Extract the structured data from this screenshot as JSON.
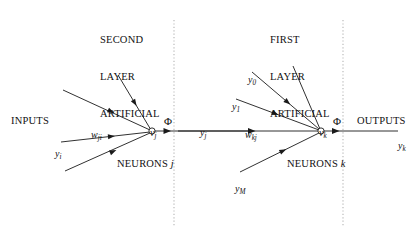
{
  "diagram": {
    "title_hidden": "",
    "background_color": "#ffffff",
    "line_color": "#1a1a1a",
    "divider_color": "#b0b0b0",
    "headers": {
      "second_layer": {
        "line1": "SECOND",
        "line2": "LAYER",
        "line3": "ARTIFICIAL",
        "line4_prefix": "NEURONS",
        "line4_index": "j"
      },
      "first_layer": {
        "line1": "FIRST",
        "line2": "LAYER",
        "line3": "ARTIFICIAL",
        "line4_prefix": "NEURONS",
        "line4_index": "k"
      }
    },
    "side_labels": {
      "inputs": "INPUTS",
      "outputs": "OUTPUTS"
    },
    "nodes": [
      {
        "id": "vj",
        "symbol": "v",
        "subscript": "j",
        "x": 152,
        "y": 131
      },
      {
        "id": "vk",
        "symbol": "v",
        "subscript": "k",
        "x": 321,
        "y": 131
      }
    ],
    "activations": [
      {
        "id": "phi-left",
        "symbol": "Φ",
        "x": 168,
        "y": 122
      },
      {
        "id": "phi-right",
        "symbol": "Φ",
        "x": 337,
        "y": 122
      }
    ],
    "signals": {
      "y_i": {
        "symbol": "y",
        "subscript": "i"
      },
      "y_j": {
        "symbol": "y",
        "subscript": "j"
      },
      "y_k": {
        "symbol": "y",
        "subscript": "k"
      },
      "y_0": {
        "symbol": "y",
        "subscript": "0"
      },
      "y_1": {
        "symbol": "y",
        "subscript": "1"
      },
      "y_M": {
        "symbol": "y",
        "subscript": "M"
      }
    },
    "weights": {
      "w_ji": {
        "symbol": "w",
        "subscript": "ji"
      },
      "w_kj": {
        "symbol": "w",
        "subscript": "kj"
      }
    },
    "dividers": [
      {
        "id": "divider-left",
        "x": 174,
        "y_top": 20,
        "y_bottom": 226
      },
      {
        "id": "divider-right",
        "x": 343,
        "y_top": 20,
        "y_bottom": 226
      }
    ]
  }
}
